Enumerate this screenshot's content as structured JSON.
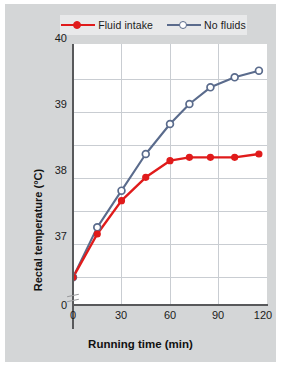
{
  "figure": {
    "background_color": "#d4d6d7",
    "plot_background_color": "#ffffff",
    "axis_color": "#58595b",
    "grid_color": "#c9cdd2"
  },
  "legend": {
    "position": "top-center",
    "background_color": "#e8e9ea",
    "entries": [
      {
        "label": "Fluid intake",
        "color": "#e01b1b",
        "marker": "filled-circle",
        "marker_fill": "#e01b1b",
        "icon": "legend-line-marker-icon"
      },
      {
        "label": "No fluids",
        "color": "#5a6b8c",
        "marker": "open-circle",
        "marker_fill": "#ffffff",
        "icon": "legend-line-marker-icon"
      }
    ]
  },
  "axes": {
    "y": {
      "title": "Rectal temperature (°C)",
      "tick_labels": [
        "40",
        "39",
        "38",
        "37",
        "0"
      ],
      "broken": true,
      "break_symbol": "axis-break-icon",
      "range": [
        36.6,
        40.5
      ],
      "major_ticks": [
        37,
        38,
        39,
        40
      ],
      "gridlines": [
        37.0,
        37.5,
        38.0,
        38.5,
        39.0,
        39.5,
        40.0
      ]
    },
    "x": {
      "title": "Running time (min)",
      "tick_labels": [
        "0",
        "30",
        "60",
        "90",
        "120"
      ],
      "range": [
        0,
        120
      ],
      "major_ticks": [
        0,
        30,
        60,
        90,
        120
      ],
      "gridlines": [
        30,
        60,
        90
      ]
    }
  },
  "chart_data": {
    "type": "line",
    "title": "",
    "xlabel": "Running time (min)",
    "ylabel": "Rectal temperature (°C)",
    "xlim": [
      0,
      120
    ],
    "ylim": [
      36.6,
      40.5
    ],
    "grid": true,
    "legend_position": "top-center",
    "series": [
      {
        "name": "Fluid intake",
        "color": "#e01b1b",
        "marker": "filled-circle",
        "x": [
          0,
          15,
          30,
          45,
          60,
          72,
          85,
          100,
          115
        ],
        "y": [
          37.0,
          37.65,
          38.15,
          38.5,
          38.75,
          38.8,
          38.8,
          38.8,
          38.85
        ]
      },
      {
        "name": "No fluids",
        "color": "#5a6b8c",
        "marker": "open-circle",
        "x": [
          0,
          15,
          30,
          45,
          60,
          72,
          85,
          100,
          115
        ],
        "y": [
          37.0,
          37.75,
          38.3,
          38.85,
          39.3,
          39.6,
          39.85,
          40.0,
          40.1
        ]
      }
    ]
  }
}
